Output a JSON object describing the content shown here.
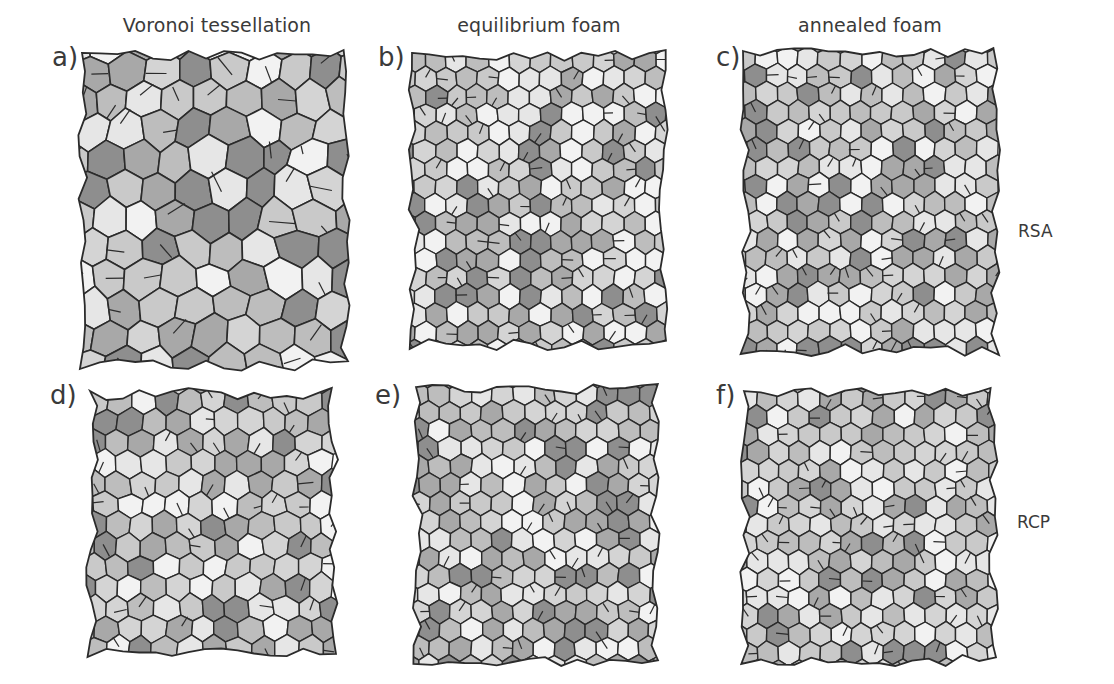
{
  "figure": {
    "column_titles": [
      "Voronoi tessellation",
      "equilibrium foam",
      "annealed foam"
    ],
    "row_labels": [
      "RSA",
      "RCP"
    ],
    "panels": [
      {
        "label": "a)",
        "row": 0,
        "col": 0,
        "title": "Voronoi tessellation",
        "packing": "RSA",
        "cell_size": "irregular",
        "seed": 11
      },
      {
        "label": "b)",
        "row": 0,
        "col": 1,
        "title": "equilibrium foam",
        "packing": "RSA",
        "cell_size": "uniform",
        "seed": 23
      },
      {
        "label": "c)",
        "row": 0,
        "col": 2,
        "title": "annealed foam",
        "packing": "RSA",
        "cell_size": "uniform",
        "seed": 37
      },
      {
        "label": "d)",
        "row": 1,
        "col": 0,
        "title": "Voronoi tessellation",
        "packing": "RCP",
        "cell_size": "semi-regular",
        "seed": 41
      },
      {
        "label": "e)",
        "row": 1,
        "col": 1,
        "title": "equilibrium foam",
        "packing": "RCP",
        "cell_size": "uniform",
        "seed": 53
      },
      {
        "label": "f)",
        "row": 1,
        "col": 2,
        "title": "annealed foam",
        "packing": "RCP",
        "cell_size": "uniform",
        "seed": 67
      }
    ],
    "colors": {
      "edge": "#2b2b2b",
      "face_light": "#e6e6e6",
      "face_mid": "#bdbdbd",
      "face_dark": "#8e8e8e",
      "text": "#3a3a3a",
      "background": "#ffffff"
    }
  }
}
